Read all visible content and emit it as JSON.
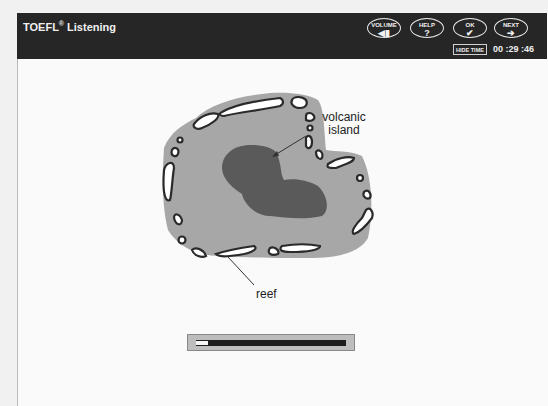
{
  "header": {
    "title": "TOEFL",
    "title_mark": "®",
    "title_suffix": " Listening",
    "buttons": [
      {
        "label": "VOLUME",
        "icon": "speaker-icon",
        "glyph": "◀▮"
      },
      {
        "label": "HELP",
        "icon": "question-icon",
        "glyph": "?"
      },
      {
        "label": "OK",
        "icon": "checkmark-icon",
        "glyph": "✔"
      },
      {
        "label": "NEXT",
        "icon": "arrow-right-icon",
        "glyph": "➔"
      }
    ],
    "hide_time_label": "HIDE TIME",
    "timer": "00 :29 :46"
  },
  "diagram": {
    "labels": {
      "island": "volcanic island",
      "island_line1": "volcanic",
      "island_line2": "island",
      "reef": "reef"
    },
    "colors": {
      "lagoon": "#a6a6a6",
      "island": "#5a5a5a",
      "reef_outline": "#2a2a2a",
      "reef_fill": "#ffffff"
    }
  },
  "progress": {
    "percent": 8
  }
}
